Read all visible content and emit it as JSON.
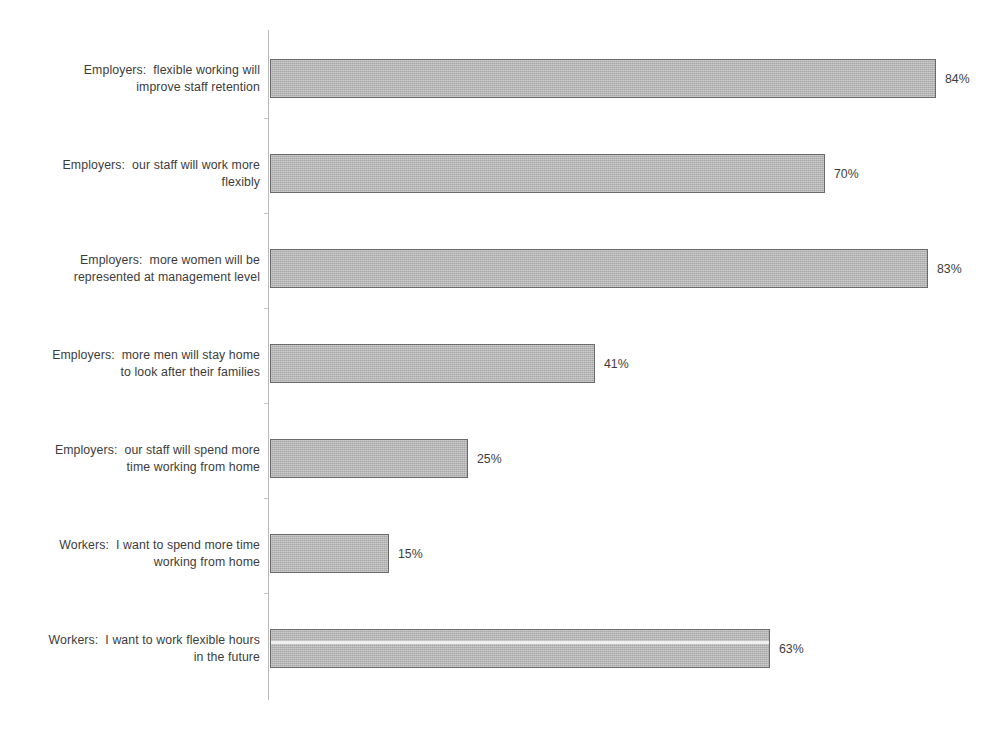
{
  "chart_data": {
    "type": "bar",
    "orientation": "horizontal",
    "title": "",
    "subtitle": "",
    "xlabel": "",
    "ylabel": "",
    "xlim": [
      0,
      100
    ],
    "grid": false,
    "legend": false,
    "value_suffix": "%",
    "categories": [
      "Employers:  flexible working will improve staff retention",
      "Employers:  our staff will work more flexibly",
      "Employers:  more women will be represented at management level",
      "Employers:  more men will stay home to look after their families",
      "Employers:  our staff will spend more time working from home",
      "Workers:  I want to spend more time working from home",
      "Workers:  I want to work flexible hours in the future"
    ],
    "values": [
      84,
      70,
      83,
      41,
      25,
      15,
      63
    ],
    "value_labels": [
      "84%",
      "70%",
      "83%",
      "41%",
      "25%",
      "15%",
      "63%"
    ],
    "bars": [
      {
        "label_line1": "Employers:  flexible working will",
        "label_line2": "improve staff retention",
        "value": 84,
        "value_label": "84%"
      },
      {
        "label_line1": "Employers:  our staff will work more",
        "label_line2": "flexibly",
        "value": 70,
        "value_label": "70%"
      },
      {
        "label_line1": "Employers:  more women will be",
        "label_line2": "represented at management level",
        "value": 83,
        "value_label": "83%"
      },
      {
        "label_line1": "Employers:  more men will stay home",
        "label_line2": "to look after their families",
        "value": 41,
        "value_label": "41%"
      },
      {
        "label_line1": "Employers:  our staff will spend more",
        "label_line2": "time working from home",
        "value": 25,
        "value_label": "25%"
      },
      {
        "label_line1": "Workers:  I want to spend more time",
        "label_line2": "working from home",
        "value": 15,
        "value_label": "15%"
      },
      {
        "label_line1": "Workers:  I want to work flexible hours",
        "label_line2": "in the future",
        "value": 63,
        "value_label": "63%"
      }
    ]
  },
  "style": {
    "bar_fill": "#b2b2b2",
    "bar_border": "#6a6a6a",
    "axis_line": "#b9b9b9",
    "text": "#3c3c3c",
    "background": "#ffffff"
  },
  "geometry": {
    "bar_origin_x": 270,
    "px_per_percent": 7.93,
    "row_pitch": 95,
    "first_row_top": 31,
    "bar_height": 39
  }
}
